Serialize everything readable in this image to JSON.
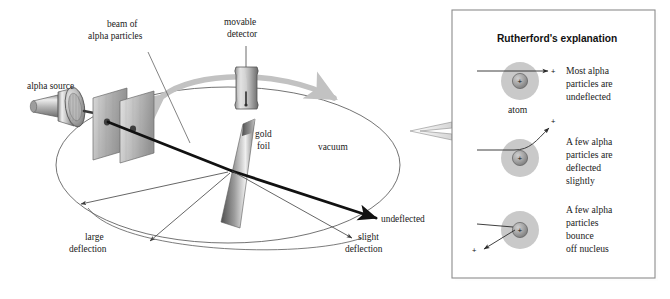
{
  "figure": {
    "background_color": "#ffffff",
    "ink_color": "#1a1a1a"
  },
  "experiment": {
    "labels": {
      "alpha_source": "alpha source",
      "beam_of_alpha_particles": "beam of\nalpha particles",
      "beam_line1": "beam of",
      "beam_line2": "alpha particles",
      "movable_detector": "movable\ndetector",
      "detector_line1": "movable",
      "detector_line2": "detector",
      "gold_foil": "gold\nfoil",
      "gold_line1": "gold",
      "gold_line2": "foil",
      "vacuum": "vacuum",
      "undeflected": "undeflected",
      "slight_deflection": "slight\ndeflection",
      "slight_line1": "slight",
      "slight_line2": "deflection",
      "large_deflection": "large\ndeflection",
      "large_line1": "large",
      "large_line2": "deflection"
    },
    "colors": {
      "metal_light": "#e3e3e3",
      "metal_mid": "#a9a9a9",
      "metal_dark": "#6b6b6b",
      "foil_light": "#f0f0f0",
      "foil_dark": "#5d5d5d",
      "beam": "#111111",
      "thin_line": "#5a5a5a",
      "motion_arrow": "#c2c2c2"
    }
  },
  "panel": {
    "title": "Rutherford's explanation",
    "border_color": "#8c8c8c",
    "background_color": "#ffffff",
    "atom_label": "atom",
    "charge_symbol": "+",
    "colors": {
      "electron_cloud": "#c9c9c9",
      "nucleus_light": "#b0b0b0",
      "nucleus_dark": "#7c7c7c"
    },
    "cases": [
      {
        "id": "undeflected",
        "caption": "Most alpha\nparticles are\nundeflected",
        "caption_lines": [
          "Most alpha",
          "particles are",
          "undeflected"
        ],
        "path": "straight-through"
      },
      {
        "id": "slight",
        "caption": "A few alpha\nparticles are\ndeflected\nslightly",
        "caption_lines": [
          "A few alpha",
          "particles are",
          "deflected",
          "slightly"
        ],
        "path": "curved-upward"
      },
      {
        "id": "bounce",
        "caption": "A few alpha\nparticles\nbounce\noff nucleus",
        "caption_lines": [
          "A few alpha",
          "particles",
          "bounce",
          "off nucleus"
        ],
        "path": "backscatter"
      }
    ]
  }
}
